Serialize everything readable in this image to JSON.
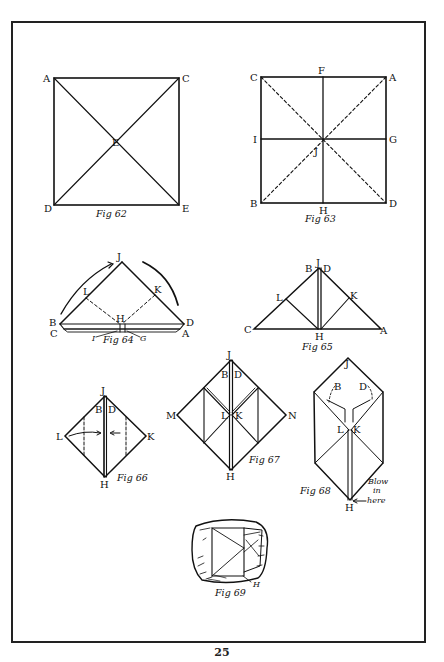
{
  "page": {
    "page_number": "25",
    "colors": {
      "ink": "#111111",
      "paper": "#ffffff"
    }
  },
  "figures": {
    "fig62": {
      "caption": "Fig 62",
      "labels": {
        "A": "A",
        "C": "C",
        "E_center": "E",
        "D": "D",
        "E_corner": "E"
      }
    },
    "fig63": {
      "caption": "Fig 63",
      "labels": {
        "C": "C",
        "F": "F",
        "A": "A",
        "I": "I",
        "G": "G",
        "J": "J",
        "B": "B",
        "H": "H",
        "D": "D"
      }
    },
    "fig64": {
      "caption": "Fig 64",
      "labels": {
        "J": "J",
        "L": "L",
        "K": "K",
        "H": "H",
        "B": "B",
        "C": "C",
        "D": "D",
        "A": "A",
        "I": "I",
        "G": "G"
      }
    },
    "fig65": {
      "caption": "Fig 65",
      "labels": {
        "B": "B",
        "J": "J",
        "D": "D",
        "L": "L",
        "K": "K",
        "C": "C",
        "H": "H",
        "A": "A"
      }
    },
    "fig66": {
      "caption": "Fig 66",
      "labels": {
        "J": "J",
        "B": "B",
        "D": "D",
        "L": "L",
        "K": "K",
        "H": "H"
      }
    },
    "fig67": {
      "caption": "Fig 67",
      "labels": {
        "J": "J",
        "B": "B",
        "D": "D",
        "M": "M",
        "N": "N",
        "L": "L",
        "K": "K",
        "H": "H"
      }
    },
    "fig68": {
      "caption": "Fig 68",
      "labels": {
        "J": "J",
        "B": "B",
        "D": "D",
        "L": "L",
        "K": "K",
        "H": "H"
      },
      "note_line1": "Blow",
      "note_line2": "in",
      "note_line3": "here"
    },
    "fig69": {
      "caption": "Fig 69",
      "labels": {
        "H": "H"
      }
    }
  }
}
